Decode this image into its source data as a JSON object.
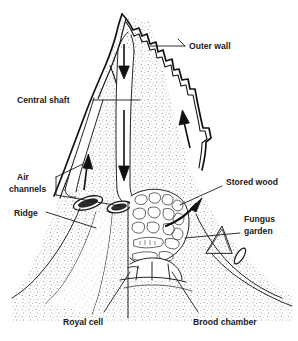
{
  "figure": {
    "background_color": "#ffffff",
    "ink_color": "#1a1a1a",
    "stipple_color": "#5a5a5a",
    "width": 298,
    "height": 341
  },
  "labels": {
    "outer_wall": "Outer wall",
    "central_shaft": "Central shaft",
    "air_channels_line1": "Air",
    "air_channels_line2": "channels",
    "ridge": "Ridge",
    "stored_wood": "Stored wood",
    "fungus_garden_line1": "Fungus",
    "fungus_garden_line2": "garden",
    "royal_cell": "Royal cell",
    "brood_chamber": "Brood chamber"
  },
  "parts": [
    {
      "id": "outer-wall",
      "label": "Outer wall",
      "side": "right",
      "leader": true
    },
    {
      "id": "central-shaft",
      "label": "Central shaft",
      "side": "left",
      "leader": true
    },
    {
      "id": "air-channels",
      "label": "Air channels",
      "side": "left",
      "leader": true
    },
    {
      "id": "ridge",
      "label": "Ridge",
      "side": "left",
      "leader": true
    },
    {
      "id": "stored-wood",
      "label": "Stored wood",
      "side": "right",
      "leader": true
    },
    {
      "id": "fungus-garden",
      "label": "Fungus garden",
      "side": "right",
      "leader": true
    },
    {
      "id": "royal-cell",
      "label": "Royal cell",
      "side": "bottom",
      "leader": true
    },
    {
      "id": "brood-chamber",
      "label": "Brood chamber",
      "side": "bottom",
      "leader": true
    }
  ],
  "airflow": [
    {
      "id": "down-arrow-upper",
      "direction": "down",
      "location": "central-shaft-upper"
    },
    {
      "id": "down-arrow-lower",
      "direction": "down",
      "location": "central-shaft-lower"
    },
    {
      "id": "up-arrow-left",
      "direction": "up",
      "location": "left-air-channel"
    },
    {
      "id": "up-arrow-right",
      "direction": "up",
      "location": "right-air-channel"
    },
    {
      "id": "curved-arrow",
      "direction": "up-right",
      "location": "fungus-garden-outflow"
    }
  ]
}
